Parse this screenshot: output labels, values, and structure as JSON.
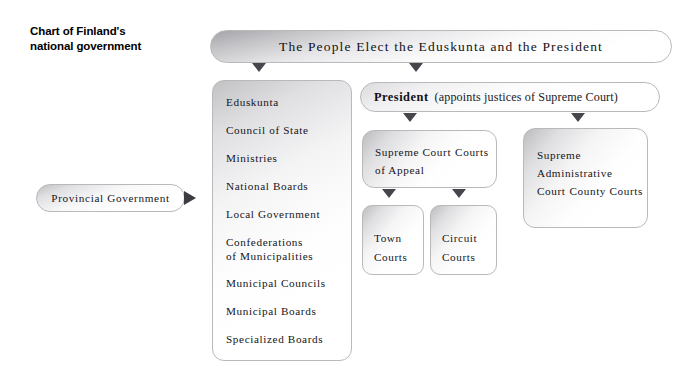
{
  "title": {
    "text": "Chart of Finland's\nnational government"
  },
  "banner": {
    "label": "The People Elect the Eduskunta and the President"
  },
  "legislative_column": {
    "items": [
      "Eduskunta",
      "Council of State",
      "Ministries",
      "National Boards",
      "Local Government",
      "Confederations\nof Municipalities",
      "Municipal Councils",
      "Municipal Boards",
      "Specialized Boards"
    ]
  },
  "provincial": {
    "label": "Provincial Government"
  },
  "president": {
    "label": "President",
    "note": "(appoints justices of Supreme Court)"
  },
  "supreme_court": {
    "line1": "Supreme Court",
    "line2": "Courts of Appeal"
  },
  "town_courts": {
    "label": "Town\nCourts"
  },
  "circuit_courts": {
    "label": "Circuit\nCourts"
  },
  "administrative_court": {
    "line1": "Supreme\nAdministrative\nCourt",
    "line2": "County Courts"
  },
  "colors": {
    "background": "#ffffff",
    "text": "#15151a",
    "box_border": "#b9b9bc",
    "arrow": "#46464c",
    "arrow_right": "#3c3c42"
  }
}
